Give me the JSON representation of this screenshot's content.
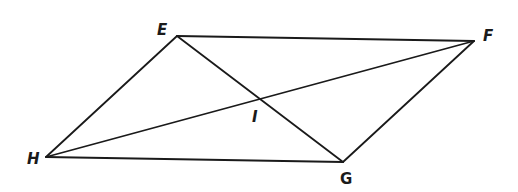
{
  "diagram": {
    "type": "parallelogram-with-diagonals",
    "stroke_color": "#1a1a1a",
    "background_color": "#ffffff",
    "vertices": [
      {
        "name": "E",
        "x": 177,
        "y": 36,
        "label_x": 157,
        "label_y": 35
      },
      {
        "name": "F",
        "x": 474,
        "y": 41,
        "label_x": 483,
        "label_y": 41
      },
      {
        "name": "G",
        "x": 343,
        "y": 162,
        "label_x": 340,
        "label_y": 184
      },
      {
        "name": "H",
        "x": 46,
        "y": 157,
        "label_x": 27,
        "label_y": 164
      }
    ],
    "intersection": {
      "name": "I",
      "x": 259,
      "y": 99,
      "label_x": 252,
      "label_y": 122
    },
    "sides": [
      {
        "from": "E",
        "to": "F"
      },
      {
        "from": "F",
        "to": "G"
      },
      {
        "from": "G",
        "to": "H"
      },
      {
        "from": "H",
        "to": "E"
      }
    ],
    "diagonals": [
      {
        "from": "E",
        "to": "G"
      },
      {
        "from": "H",
        "to": "F"
      }
    ],
    "labels": {
      "E": "E",
      "F": "F",
      "G": "G",
      "H": "H",
      "I": "I"
    }
  }
}
